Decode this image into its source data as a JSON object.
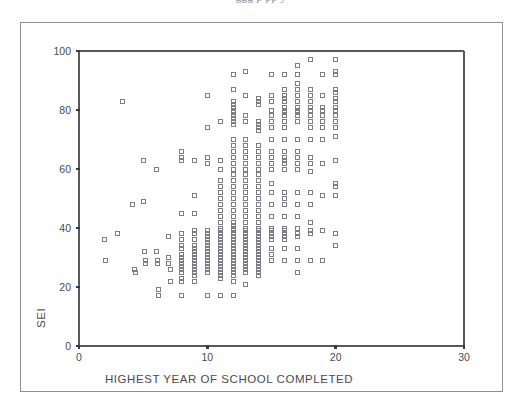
{
  "page": {
    "top_clipped_text": "ggg p   pp  y"
  },
  "chart_data": {
    "type": "scatter",
    "title": "",
    "xlabel": "HIGHEST YEAR OF SCHOOL COMPLETED",
    "ylabel": "SEI",
    "xlim": [
      0,
      30
    ],
    "ylim": [
      0,
      100
    ],
    "xticks": [
      0,
      10,
      20,
      30
    ],
    "yticks": [
      0,
      20,
      40,
      60,
      80,
      100
    ],
    "grid": false,
    "legend": null,
    "marker": {
      "shape": "open-square",
      "size_px": 4,
      "stroke": "#7d7d86",
      "fill": "none"
    },
    "axis_color": "#58585e",
    "points": [
      [
        2.0,
        36
      ],
      [
        2.1,
        29
      ],
      [
        3.0,
        38
      ],
      [
        3.4,
        83
      ],
      [
        4.2,
        48
      ],
      [
        4.3,
        26
      ],
      [
        4.4,
        25
      ],
      [
        5.0,
        63
      ],
      [
        5.0,
        49
      ],
      [
        5.1,
        32
      ],
      [
        5.2,
        29
      ],
      [
        5.2,
        28
      ],
      [
        6.0,
        60
      ],
      [
        6.0,
        32
      ],
      [
        6.1,
        29
      ],
      [
        6.1,
        28
      ],
      [
        6.2,
        19
      ],
      [
        6.2,
        17
      ],
      [
        7.0,
        37
      ],
      [
        7.0,
        30
      ],
      [
        7.0,
        28
      ],
      [
        7.1,
        26
      ],
      [
        7.1,
        22
      ],
      [
        8.0,
        66
      ],
      [
        8.0,
        64
      ],
      [
        8.0,
        63
      ],
      [
        8.0,
        45
      ],
      [
        8.0,
        38
      ],
      [
        8.0,
        36
      ],
      [
        8.0,
        34
      ],
      [
        8.0,
        33
      ],
      [
        8.0,
        31
      ],
      [
        8.0,
        30
      ],
      [
        8.0,
        29
      ],
      [
        8.0,
        28
      ],
      [
        8.0,
        27
      ],
      [
        8.0,
        26
      ],
      [
        8.0,
        25
      ],
      [
        8.0,
        23
      ],
      [
        8.0,
        22
      ],
      [
        8.0,
        17
      ],
      [
        9.0,
        63
      ],
      [
        9.0,
        51
      ],
      [
        9.0,
        45
      ],
      [
        9.0,
        39
      ],
      [
        9.0,
        38
      ],
      [
        9.0,
        36
      ],
      [
        9.0,
        34
      ],
      [
        9.0,
        33
      ],
      [
        9.0,
        32
      ],
      [
        9.0,
        31
      ],
      [
        9.0,
        30
      ],
      [
        9.0,
        29
      ],
      [
        9.0,
        28
      ],
      [
        9.0,
        27
      ],
      [
        9.0,
        26
      ],
      [
        9.0,
        25
      ],
      [
        9.0,
        24
      ],
      [
        9.0,
        22
      ],
      [
        10.0,
        85
      ],
      [
        10.0,
        74
      ],
      [
        10.0,
        64
      ],
      [
        10.0,
        62
      ],
      [
        10.0,
        39
      ],
      [
        10.0,
        38
      ],
      [
        10.0,
        37
      ],
      [
        10.0,
        36
      ],
      [
        10.0,
        35
      ],
      [
        10.0,
        34
      ],
      [
        10.0,
        33
      ],
      [
        10.0,
        32
      ],
      [
        10.0,
        31
      ],
      [
        10.0,
        30
      ],
      [
        10.0,
        29
      ],
      [
        10.0,
        28
      ],
      [
        10.0,
        27
      ],
      [
        10.0,
        26
      ],
      [
        10.0,
        25
      ],
      [
        10.0,
        17
      ],
      [
        11.0,
        76
      ],
      [
        11.0,
        63
      ],
      [
        11.0,
        60
      ],
      [
        11.0,
        56
      ],
      [
        11.0,
        54
      ],
      [
        11.0,
        52
      ],
      [
        11.0,
        50
      ],
      [
        11.0,
        48
      ],
      [
        11.0,
        46
      ],
      [
        11.0,
        44
      ],
      [
        11.0,
        42
      ],
      [
        11.0,
        40
      ],
      [
        11.0,
        39
      ],
      [
        11.0,
        38
      ],
      [
        11.0,
        37
      ],
      [
        11.0,
        36
      ],
      [
        11.0,
        35
      ],
      [
        11.0,
        34
      ],
      [
        11.0,
        33
      ],
      [
        11.0,
        32
      ],
      [
        11.0,
        31
      ],
      [
        11.0,
        30
      ],
      [
        11.0,
        29
      ],
      [
        11.0,
        28
      ],
      [
        11.0,
        27
      ],
      [
        11.0,
        26
      ],
      [
        11.0,
        25
      ],
      [
        11.0,
        24
      ],
      [
        11.0,
        23
      ],
      [
        11.0,
        17
      ],
      [
        12.0,
        92
      ],
      [
        12.0,
        87
      ],
      [
        12.0,
        83
      ],
      [
        12.0,
        82
      ],
      [
        12.0,
        81
      ],
      [
        12.0,
        80
      ],
      [
        12.0,
        79
      ],
      [
        12.0,
        78
      ],
      [
        12.0,
        77
      ],
      [
        12.0,
        76
      ],
      [
        12.0,
        75
      ],
      [
        12.0,
        70
      ],
      [
        12.0,
        68
      ],
      [
        12.0,
        66
      ],
      [
        12.0,
        64
      ],
      [
        12.0,
        62
      ],
      [
        12.0,
        60
      ],
      [
        12.0,
        58
      ],
      [
        12.0,
        56
      ],
      [
        12.0,
        54
      ],
      [
        12.0,
        52
      ],
      [
        12.0,
        50
      ],
      [
        12.0,
        48
      ],
      [
        12.0,
        46
      ],
      [
        12.0,
        44
      ],
      [
        12.0,
        42
      ],
      [
        12.0,
        41
      ],
      [
        12.0,
        40
      ],
      [
        12.0,
        39
      ],
      [
        12.0,
        38
      ],
      [
        12.0,
        37
      ],
      [
        12.0,
        36
      ],
      [
        12.0,
        35
      ],
      [
        12.0,
        34
      ],
      [
        12.0,
        33
      ],
      [
        12.0,
        32
      ],
      [
        12.0,
        31
      ],
      [
        12.0,
        30
      ],
      [
        12.0,
        29
      ],
      [
        12.0,
        28
      ],
      [
        12.0,
        27
      ],
      [
        12.0,
        26
      ],
      [
        12.0,
        25
      ],
      [
        12.0,
        24
      ],
      [
        12.0,
        22
      ],
      [
        12.0,
        17
      ],
      [
        13.0,
        93
      ],
      [
        13.0,
        85
      ],
      [
        13.0,
        78
      ],
      [
        13.0,
        76
      ],
      [
        13.0,
        70
      ],
      [
        13.0,
        68
      ],
      [
        13.0,
        66
      ],
      [
        13.0,
        64
      ],
      [
        13.0,
        62
      ],
      [
        13.0,
        60
      ],
      [
        13.0,
        58
      ],
      [
        13.0,
        56
      ],
      [
        13.0,
        54
      ],
      [
        13.0,
        52
      ],
      [
        13.0,
        50
      ],
      [
        13.0,
        48
      ],
      [
        13.0,
        46
      ],
      [
        13.0,
        44
      ],
      [
        13.0,
        42
      ],
      [
        13.0,
        40
      ],
      [
        13.0,
        39
      ],
      [
        13.0,
        38
      ],
      [
        13.0,
        37
      ],
      [
        13.0,
        36
      ],
      [
        13.0,
        35
      ],
      [
        13.0,
        34
      ],
      [
        13.0,
        33
      ],
      [
        13.0,
        32
      ],
      [
        13.0,
        31
      ],
      [
        13.0,
        30
      ],
      [
        13.0,
        29
      ],
      [
        13.0,
        28
      ],
      [
        13.0,
        27
      ],
      [
        13.0,
        26
      ],
      [
        13.0,
        25
      ],
      [
        13.0,
        21
      ],
      [
        14.0,
        84
      ],
      [
        14.0,
        83
      ],
      [
        14.0,
        82
      ],
      [
        14.0,
        76
      ],
      [
        14.0,
        75
      ],
      [
        14.0,
        74
      ],
      [
        14.0,
        73
      ],
      [
        14.0,
        68
      ],
      [
        14.0,
        66
      ],
      [
        14.0,
        64
      ],
      [
        14.0,
        62
      ],
      [
        14.0,
        60
      ],
      [
        14.0,
        58
      ],
      [
        14.0,
        56
      ],
      [
        14.0,
        54
      ],
      [
        14.0,
        52
      ],
      [
        14.0,
        50
      ],
      [
        14.0,
        48
      ],
      [
        14.0,
        46
      ],
      [
        14.0,
        44
      ],
      [
        14.0,
        42
      ],
      [
        14.0,
        40
      ],
      [
        14.0,
        39
      ],
      [
        14.0,
        38
      ],
      [
        14.0,
        37
      ],
      [
        14.0,
        36
      ],
      [
        14.0,
        35
      ],
      [
        14.0,
        34
      ],
      [
        14.0,
        33
      ],
      [
        14.0,
        32
      ],
      [
        14.0,
        31
      ],
      [
        14.0,
        30
      ],
      [
        14.0,
        29
      ],
      [
        14.0,
        28
      ],
      [
        14.0,
        27
      ],
      [
        14.0,
        26
      ],
      [
        14.0,
        25
      ],
      [
        14.0,
        24
      ],
      [
        15.0,
        92
      ],
      [
        15.0,
        85
      ],
      [
        15.0,
        83
      ],
      [
        15.0,
        80
      ],
      [
        15.0,
        78
      ],
      [
        15.0,
        76
      ],
      [
        15.0,
        74
      ],
      [
        15.0,
        70
      ],
      [
        15.0,
        66
      ],
      [
        15.0,
        64
      ],
      [
        15.0,
        62
      ],
      [
        15.0,
        60
      ],
      [
        15.0,
        55
      ],
      [
        15.0,
        52
      ],
      [
        15.0,
        48
      ],
      [
        15.0,
        44
      ],
      [
        15.0,
        40
      ],
      [
        15.0,
        39
      ],
      [
        15.0,
        38
      ],
      [
        15.0,
        37
      ],
      [
        15.0,
        36
      ],
      [
        15.0,
        33
      ],
      [
        15.0,
        31
      ],
      [
        15.0,
        29
      ],
      [
        16.0,
        92
      ],
      [
        16.0,
        87
      ],
      [
        16.0,
        85
      ],
      [
        16.0,
        84
      ],
      [
        16.0,
        83
      ],
      [
        16.0,
        81
      ],
      [
        16.0,
        80
      ],
      [
        16.0,
        79
      ],
      [
        16.0,
        78
      ],
      [
        16.0,
        76
      ],
      [
        16.0,
        74
      ],
      [
        16.0,
        70
      ],
      [
        16.0,
        66
      ],
      [
        16.0,
        64
      ],
      [
        16.0,
        63
      ],
      [
        16.0,
        62
      ],
      [
        16.0,
        60
      ],
      [
        16.0,
        52
      ],
      [
        16.0,
        50
      ],
      [
        16.0,
        48
      ],
      [
        16.0,
        44
      ],
      [
        16.0,
        40
      ],
      [
        16.0,
        39
      ],
      [
        16.0,
        38
      ],
      [
        16.0,
        37
      ],
      [
        16.0,
        36
      ],
      [
        16.0,
        33
      ],
      [
        16.0,
        29
      ],
      [
        17.0,
        95
      ],
      [
        17.0,
        92
      ],
      [
        17.0,
        89
      ],
      [
        17.0,
        87
      ],
      [
        17.0,
        85
      ],
      [
        17.0,
        83
      ],
      [
        17.0,
        81
      ],
      [
        17.0,
        80
      ],
      [
        17.0,
        79
      ],
      [
        17.0,
        78
      ],
      [
        17.0,
        76
      ],
      [
        17.0,
        70
      ],
      [
        17.0,
        66
      ],
      [
        17.0,
        64
      ],
      [
        17.0,
        62
      ],
      [
        17.0,
        60
      ],
      [
        17.0,
        52
      ],
      [
        17.0,
        48
      ],
      [
        17.0,
        44
      ],
      [
        17.0,
        40
      ],
      [
        17.0,
        38
      ],
      [
        17.0,
        37
      ],
      [
        17.0,
        33
      ],
      [
        17.0,
        29
      ],
      [
        17.0,
        25
      ],
      [
        18.0,
        97
      ],
      [
        18.0,
        87
      ],
      [
        18.0,
        85
      ],
      [
        18.0,
        83
      ],
      [
        18.0,
        81
      ],
      [
        18.0,
        80
      ],
      [
        18.0,
        78
      ],
      [
        18.0,
        76
      ],
      [
        18.0,
        74
      ],
      [
        18.0,
        70
      ],
      [
        18.0,
        64
      ],
      [
        18.0,
        62
      ],
      [
        18.0,
        59
      ],
      [
        18.0,
        52
      ],
      [
        18.0,
        48
      ],
      [
        18.0,
        42
      ],
      [
        18.0,
        39
      ],
      [
        18.0,
        38
      ],
      [
        18.0,
        29
      ],
      [
        19.0,
        92
      ],
      [
        19.0,
        85
      ],
      [
        19.0,
        81
      ],
      [
        19.0,
        80
      ],
      [
        19.0,
        78
      ],
      [
        19.0,
        76
      ],
      [
        19.0,
        74
      ],
      [
        19.0,
        70
      ],
      [
        19.0,
        62
      ],
      [
        19.0,
        51
      ],
      [
        19.0,
        39
      ],
      [
        19.0,
        29
      ],
      [
        20.0,
        97
      ],
      [
        20.0,
        93
      ],
      [
        20.0,
        92
      ],
      [
        20.0,
        87
      ],
      [
        20.0,
        86
      ],
      [
        20.0,
        84
      ],
      [
        20.0,
        83
      ],
      [
        20.0,
        81
      ],
      [
        20.0,
        80
      ],
      [
        20.0,
        78
      ],
      [
        20.0,
        76
      ],
      [
        20.0,
        74
      ],
      [
        20.0,
        71
      ],
      [
        20.0,
        63
      ],
      [
        20.0,
        55
      ],
      [
        20.0,
        54
      ],
      [
        20.0,
        51
      ],
      [
        20.0,
        38
      ],
      [
        20.0,
        34
      ]
    ]
  }
}
